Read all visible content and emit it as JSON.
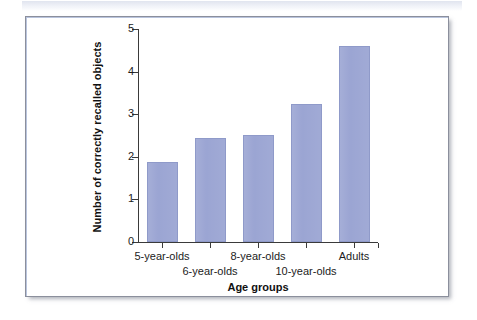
{
  "figure": {
    "panel_border_color": "#8b8f9c",
    "background_color": "#ffffff",
    "scan_band_color": "#dfe3ee"
  },
  "chart_data": {
    "type": "bar",
    "title": "",
    "subtitle": "",
    "xlabel": "Age groups",
    "ylabel": "Number of correctly recalled objects",
    "categories": [
      "5-year-olds",
      "6-year-olds",
      "8-year-olds",
      "10-year-olds",
      "Adults"
    ],
    "values": [
      1.88,
      2.45,
      2.52,
      3.25,
      4.6
    ],
    "series": [
      {
        "name": "Number of correctly recalled objects",
        "values": [
          1.88,
          2.45,
          2.52,
          3.25,
          4.6
        ]
      }
    ],
    "ylim": [
      0,
      5
    ],
    "xlim": [
      0,
      5
    ],
    "ytick_labels": [
      "0",
      "1",
      "2",
      "3",
      "4",
      "5"
    ],
    "ytick_values": [
      0,
      1,
      2,
      3,
      4,
      5
    ],
    "grid": false,
    "legend": false,
    "legend_position": "none",
    "bar_color": "#9ba5d3",
    "bar_edge_color": "#8f9ac9",
    "axis_color": "#3a3a3a",
    "xtick_label_layout": "staggered-two-rows",
    "xtick_label_rows": [
      {
        "row": "top",
        "labels": [
          "5-year-olds",
          "8-year-olds",
          "Adults"
        ]
      },
      {
        "row": "bottom",
        "labels": [
          "6-year-olds",
          "10-year-olds"
        ]
      }
    ]
  },
  "axis": {
    "y_ticks": [
      {
        "label": "5",
        "value": 5
      },
      {
        "label": "4",
        "value": 4
      },
      {
        "label": "3",
        "value": 3
      },
      {
        "label": "2",
        "value": 2
      },
      {
        "label": "1",
        "value": 1
      },
      {
        "label": "0",
        "value": 0
      }
    ],
    "y_title": "Number of correctly recalled objects",
    "x_title": "Age groups"
  },
  "bars": [
    {
      "category": "5-year-olds",
      "value": 1.88,
      "row": "top"
    },
    {
      "category": "6-year-olds",
      "value": 2.45,
      "row": "bottom"
    },
    {
      "category": "8-year-olds",
      "value": 2.52,
      "row": "top"
    },
    {
      "category": "10-year-olds",
      "value": 3.25,
      "row": "bottom"
    },
    {
      "category": "Adults",
      "value": 4.6,
      "row": "top"
    }
  ]
}
